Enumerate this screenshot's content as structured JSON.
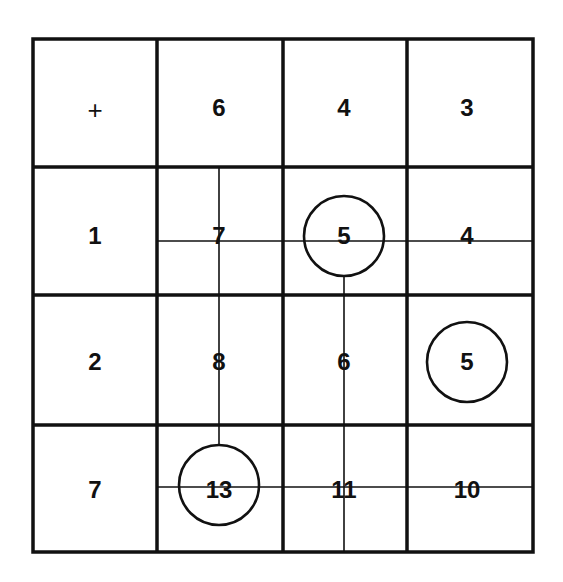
{
  "figure": {
    "type": "addition-table-grid",
    "operator": "+",
    "column_headers": [
      "6",
      "4",
      "3"
    ],
    "row_headers": [
      "1",
      "2",
      "7"
    ],
    "cells": [
      [
        "7",
        "5",
        "4"
      ],
      [
        "8",
        "6",
        "5"
      ],
      [
        "13",
        "11",
        "10"
      ]
    ],
    "circled_cells": [
      {
        "row": 0,
        "col": 1,
        "value": "5"
      },
      {
        "row": 1,
        "col": 2,
        "value": "5"
      },
      {
        "row": 2,
        "col": 0,
        "value": "13"
      }
    ],
    "colors": {
      "line": "#111111",
      "background": "#ffffff"
    }
  }
}
